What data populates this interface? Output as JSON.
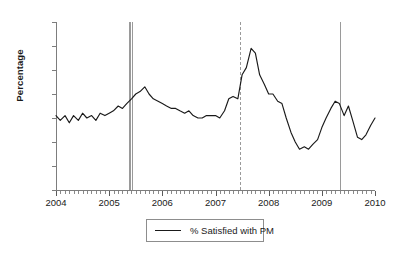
{
  "chart_data": {
    "type": "line",
    "title": "",
    "xlabel": "",
    "ylabel": "Percentage",
    "ylim": [
      0,
      70
    ],
    "xlim": [
      2004.0,
      2010.0
    ],
    "ytick_labels": [
      "0",
      "10",
      "20",
      "30",
      "40",
      "50",
      "60",
      "70"
    ],
    "ytick_values": [
      0,
      10,
      20,
      30,
      40,
      50,
      60,
      70
    ],
    "xtick_labels": [
      "2004",
      "2005",
      "2006",
      "2007",
      "2008",
      "2009",
      "2010"
    ],
    "xtick_values": [
      2004,
      2005,
      2006,
      2007,
      2008,
      2009,
      2010
    ],
    "minor_ticks": "monthly",
    "grid": false,
    "legend_position": "below-axes",
    "series": [
      {
        "name": "% Satisfied with PM",
        "color": "#1a1a1a",
        "x": [
          2004.0,
          2004.08,
          2004.17,
          2004.25,
          2004.33,
          2004.42,
          2004.5,
          2004.58,
          2004.67,
          2004.75,
          2004.83,
          2004.92,
          2005.0,
          2005.08,
          2005.17,
          2005.25,
          2005.33,
          2005.42,
          2005.5,
          2005.58,
          2005.67,
          2005.75,
          2005.83,
          2005.92,
          2006.0,
          2006.08,
          2006.17,
          2006.25,
          2006.33,
          2006.42,
          2006.5,
          2006.58,
          2006.67,
          2006.75,
          2006.83,
          2006.92,
          2007.0,
          2007.08,
          2007.17,
          2007.25,
          2007.33,
          2007.42,
          2007.5,
          2007.58,
          2007.67,
          2007.75,
          2007.83,
          2007.92,
          2008.0,
          2008.08,
          2008.17,
          2008.25,
          2008.33,
          2008.42,
          2008.5,
          2008.58,
          2008.67,
          2008.75,
          2008.83,
          2008.92,
          2009.0,
          2009.08,
          2009.17,
          2009.25,
          2009.33,
          2009.42,
          2009.5,
          2009.58,
          2009.67,
          2009.75,
          2009.83,
          2009.92,
          2010.0
        ],
        "values": [
          31,
          29,
          31,
          28,
          31,
          29,
          32,
          30,
          31,
          29,
          32,
          31,
          32,
          33,
          35,
          34,
          36,
          38,
          40,
          41,
          43,
          40,
          38,
          37,
          36,
          35,
          34,
          34,
          33,
          32,
          33,
          31,
          30,
          30,
          31,
          31,
          31,
          30,
          33,
          38,
          39,
          38,
          48,
          51,
          59,
          57,
          48,
          44,
          40,
          40,
          37,
          36,
          30,
          24,
          20,
          17,
          18,
          17,
          19,
          21,
          26,
          30,
          34,
          37,
          36,
          31,
          35,
          29,
          22,
          21,
          23,
          27,
          30
        ]
      }
    ],
    "reference_lines": [
      {
        "x": 2005.38,
        "style": "solid",
        "color": "#9a9a9a"
      },
      {
        "x": 2005.43,
        "style": "solid",
        "color": "#9a9a9a"
      },
      {
        "x": 2007.46,
        "style": "dashed",
        "color": "#9a9a9a"
      },
      {
        "x": 2009.34,
        "style": "solid",
        "color": "#9a9a9a"
      }
    ]
  },
  "legend": {
    "label": "% Satisfied with PM"
  }
}
